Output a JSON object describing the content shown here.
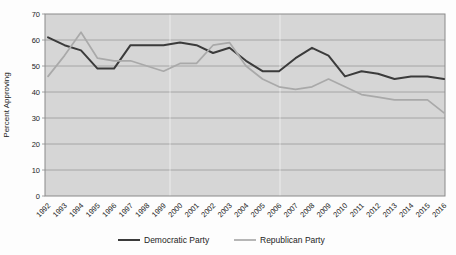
{
  "chart_data": {
    "type": "line",
    "title": "",
    "xlabel": "",
    "ylabel": "Percent Approving",
    "ylim": [
      0,
      70
    ],
    "yticks": [
      0,
      10,
      20,
      30,
      40,
      50,
      60,
      70
    ],
    "grid": "horizontal",
    "legend_position": "bottom-center",
    "plot_bg_color": "#d6d6d6",
    "grid_color": "#9b9b9b",
    "border_color": "#8a8a8a",
    "categories": [
      "1992",
      "1993",
      "1994",
      "1995",
      "1996",
      "1997",
      "1998",
      "1999",
      "2000",
      "2001",
      "2002",
      "2003",
      "2004",
      "2005",
      "2006",
      "2007",
      "2008",
      "2009",
      "2010",
      "2011",
      "2012",
      "2013",
      "2014",
      "2015",
      "2016"
    ],
    "series": [
      {
        "name": "Democratic Party",
        "color": "#3b3b3b",
        "line_width": 2,
        "values": [
          61,
          58,
          56,
          49,
          49,
          58,
          58,
          58,
          59,
          58,
          55,
          57,
          52,
          48,
          48,
          53,
          57,
          54,
          46,
          48,
          47,
          45,
          46,
          46,
          45
        ]
      },
      {
        "name": "Republican Party",
        "color": "#a9a9a9",
        "line_width": 1.7,
        "values": [
          46,
          54,
          63,
          53,
          52,
          52,
          50,
          48,
          51,
          51,
          58,
          59,
          50,
          45,
          42,
          41,
          42,
          45,
          42,
          39,
          38,
          37,
          37,
          37,
          32
        ]
      }
    ]
  }
}
